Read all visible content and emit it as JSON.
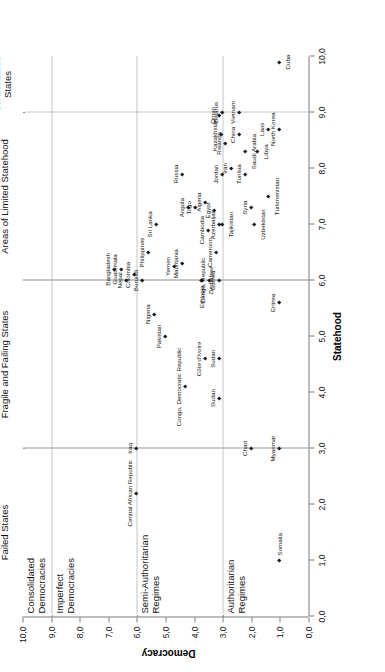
{
  "chart_data": {
    "type": "scatter",
    "title": "",
    "xlabel": "Statehood",
    "ylabel": "Democracy",
    "xlim": [
      0.0,
      10.0
    ],
    "ylim": [
      0.0,
      10.0
    ],
    "grid": "dotted separators",
    "xticks": [
      "0,0",
      "1,0",
      "2,0",
      "3,0",
      "4,0",
      "5,0",
      "6,0",
      "7,0",
      "8,0",
      "9,0",
      "10,0"
    ],
    "xtick_values": [
      0,
      1,
      2,
      3,
      4,
      5,
      6,
      7,
      8,
      9,
      10
    ],
    "yticks": [
      "0,0",
      "1,0",
      "2,0",
      "3,0",
      "4,0",
      "5,0",
      "6,0",
      "7,0",
      "8,0",
      "9,0",
      "10,0"
    ],
    "ytick_values": [
      0,
      1,
      2,
      3,
      4,
      5,
      6,
      7,
      8,
      9,
      10
    ],
    "x_regions": [
      {
        "label": "Failed States",
        "from": 0.0,
        "to": 3.0
      },
      {
        "label": "Fragile and Failing States",
        "from": 3.0,
        "to": 6.0
      },
      {
        "label": "Areas of Limited Statehood",
        "from": 6.0,
        "to": 9.0
      },
      {
        "label": "Consolidated\nStates",
        "label_line1": "Consolidated",
        "label_line2": "States",
        "from": 9.0,
        "to": 10.0
      }
    ],
    "y_regions": [
      {
        "label_line1": "Consolidated",
        "label_line2": "Democracies",
        "from": 9.0,
        "to": 10.0
      },
      {
        "label_line1": "Imperfect",
        "label_line2": "Democracies",
        "from": 6.0,
        "to": 9.0
      },
      {
        "label_line1": "Semi-Authoritarian",
        "label_line2": "Regimes",
        "from": 3.0,
        "to": 6.0
      },
      {
        "label_line1": "Authoritarian",
        "label_line2": "Regimes",
        "from": 0.0,
        "to": 3.0
      }
    ],
    "separators_x": [
      3.0,
      6.0,
      9.0
    ],
    "separators_y": [
      3.0,
      6.0,
      9.0
    ],
    "points": [
      {
        "name": "Somalia",
        "x": 1.0,
        "y": 1.0,
        "pos": "r"
      },
      {
        "name": "Myanmar",
        "x": 3.0,
        "y": 1.0,
        "pos": "a"
      },
      {
        "name": "Chad",
        "x": 3.0,
        "y": 2.0,
        "pos": "a"
      },
      {
        "name": "Eritrea",
        "x": 5.6,
        "y": 1.0,
        "pos": "a"
      },
      {
        "name": "Turkmenistan",
        "x": 7.5,
        "y": 1.4,
        "pos": "b"
      },
      {
        "name": "Libya",
        "x": 8.3,
        "y": 1.8,
        "pos": "b"
      },
      {
        "name": "Laos",
        "x": 8.7,
        "y": 1.4,
        "pos": "a"
      },
      {
        "name": "North Korea",
        "x": 8.7,
        "y": 1.0,
        "pos": "a"
      },
      {
        "name": "Cuba",
        "x": 9.9,
        "y": 1.0,
        "pos": "b"
      },
      {
        "name": "Saudi Arabia",
        "x": 8.3,
        "y": 2.2,
        "pos": "b"
      },
      {
        "name": "China",
        "x": 8.6,
        "y": 2.4,
        "pos": "a"
      },
      {
        "name": "Vietnam",
        "x": 9.0,
        "y": 2.4,
        "pos": "a"
      },
      {
        "name": "Belarus",
        "x": 9.0,
        "y": 3.0,
        "pos": "a"
      },
      {
        "name": "Oman",
        "x": 8.95,
        "y": 3.1,
        "pos": "a"
      },
      {
        "name": "Kazakhstan",
        "x": 8.6,
        "y": 3.05,
        "pos": "a"
      },
      {
        "name": "Rwanda",
        "x": 8.45,
        "y": 2.9,
        "pos": "a"
      },
      {
        "name": "Tunisia",
        "x": 7.9,
        "y": 2.2,
        "pos": "a"
      },
      {
        "name": "Iran",
        "x": 8.0,
        "y": 2.7,
        "pos": "a"
      },
      {
        "name": "Jordan",
        "x": 7.9,
        "y": 3.0,
        "pos": "a"
      },
      {
        "name": "Syria",
        "x": 7.3,
        "y": 2.0,
        "pos": "a"
      },
      {
        "name": "Uzbekistan",
        "x": 7.0,
        "y": 1.9,
        "pos": "b"
      },
      {
        "name": "Tajikistan",
        "x": 7.0,
        "y": 3.0,
        "pos": "b"
      },
      {
        "name": "Azerbaijan",
        "x": 7.0,
        "y": 3.1,
        "pos": "a"
      },
      {
        "name": "Egypt",
        "x": 7.25,
        "y": 3.3,
        "pos": "a"
      },
      {
        "name": "Cambodia",
        "x": 6.9,
        "y": 3.5,
        "pos": "a"
      },
      {
        "name": "Algeria",
        "x": 7.4,
        "y": 3.6,
        "pos": "a"
      },
      {
        "name": "Togo",
        "x": 7.3,
        "y": 3.95,
        "pos": "a"
      },
      {
        "name": "Angola",
        "x": 7.3,
        "y": 4.2,
        "pos": "a"
      },
      {
        "name": "Russia",
        "x": 7.9,
        "y": 4.4,
        "pos": "a"
      },
      {
        "name": "Sri Lanka",
        "x": 7.0,
        "y": 5.3,
        "pos": "a"
      },
      {
        "name": "Cameroon",
        "x": 6.5,
        "y": 3.2,
        "pos": "a"
      },
      {
        "name": "Guinea",
        "x": 6.0,
        "y": 3.1,
        "pos": "a"
      },
      {
        "name": "Congo, Republic",
        "x": 6.0,
        "y": 3.45,
        "pos": "a"
      },
      {
        "name": "Zimbabwe",
        "x": 6.0,
        "y": 3.7,
        "pos": "b"
      },
      {
        "name": "Ethiopia",
        "x": 6.0,
        "y": 3.75,
        "pos": "l"
      },
      {
        "name": "Mauritania",
        "x": 6.3,
        "y": 4.4,
        "pos": "a"
      },
      {
        "name": "Yemen",
        "x": 6.25,
        "y": 4.7,
        "pos": "a"
      },
      {
        "name": "Philippines",
        "x": 6.5,
        "y": 5.6,
        "pos": "a"
      },
      {
        "name": "Burundi",
        "x": 6.0,
        "y": 5.8,
        "pos": "a"
      },
      {
        "name": "Colombia",
        "x": 6.1,
        "y": 6.1,
        "pos": "a"
      },
      {
        "name": "Nepal",
        "x": 6.0,
        "y": 6.35,
        "pos": "a"
      },
      {
        "name": "Bangladesh",
        "x": 6.2,
        "y": 6.8,
        "pos": "a"
      },
      {
        "name": "Guatemala",
        "x": 6.2,
        "y": 6.55,
        "pos": "a"
      },
      {
        "name": "Sudan",
        "x": 4.6,
        "y": 3.1,
        "pos": "a"
      },
      {
        "name": "Côte d'Ivoire",
        "x": 4.6,
        "y": 3.6,
        "pos": "a"
      },
      {
        "name": "Congo, Democratic Republic",
        "x": 4.1,
        "y": 4.3,
        "pos": "a"
      },
      {
        "name": "Sudan ",
        "x": 3.9,
        "y": 3.1,
        "pos": "a"
      },
      {
        "name": "Pakistan",
        "x": 5.0,
        "y": 5.0,
        "pos": "a"
      },
      {
        "name": "Nigeria",
        "x": 5.4,
        "y": 5.4,
        "pos": "a"
      },
      {
        "name": "Iraq",
        "x": 3.0,
        "y": 6.0,
        "pos": "a"
      },
      {
        "name": "Central African Republic",
        "x": 2.2,
        "y": 6.0,
        "pos": "a"
      }
    ]
  }
}
